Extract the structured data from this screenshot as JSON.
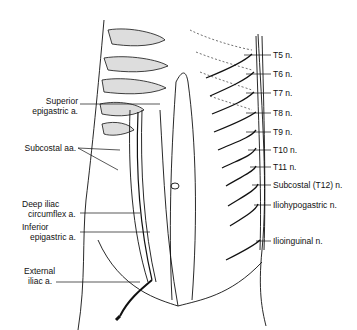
{
  "figure": {
    "left_labels": [
      {
        "lines": [
          "Superior",
          "epigastric a."
        ],
        "x": 20,
        "y": 96
      },
      {
        "lines": [
          "Subcostal aa."
        ],
        "x": 22,
        "y": 148
      },
      {
        "lines": [
          "Deep iliac",
          "circumflex a."
        ],
        "x": 22,
        "y": 203
      },
      {
        "lines": [
          "Inferior",
          "epigastric a."
        ],
        "x": 22,
        "y": 223
      },
      {
        "lines": [
          "External",
          "iliac a."
        ],
        "x": 24,
        "y": 273
      }
    ],
    "right_labels": [
      {
        "text": "T5 n.",
        "y": 55
      },
      {
        "text": "T6 n.",
        "y": 74
      },
      {
        "text": "T7 n.",
        "y": 93
      },
      {
        "text": "T8 n.",
        "y": 113
      },
      {
        "text": "T9 n.",
        "y": 132
      },
      {
        "text": "T10 n.",
        "y": 150
      },
      {
        "text": "T11 n.",
        "y": 167
      },
      {
        "text": "Subcostal (T12) n.",
        "y": 185
      },
      {
        "text": "Iliohypogastric n.",
        "y": 205
      },
      {
        "text": "Ilioinguinal n.",
        "y": 241
      }
    ]
  }
}
